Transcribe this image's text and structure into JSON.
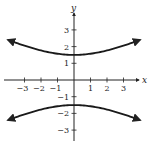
{
  "chart_data": {
    "type": "line",
    "title": "",
    "xlabel": "x",
    "ylabel": "y",
    "xlim": [
      -4,
      4
    ],
    "ylim": [
      -3.6,
      4
    ],
    "grid": false,
    "x_ticks": [
      -3,
      -2,
      -1,
      1,
      2,
      3
    ],
    "x_tick_labels": [
      "−3",
      "−2",
      "−1",
      "1",
      "2",
      "3"
    ],
    "y_ticks": [
      3,
      2,
      1,
      -1,
      -2,
      -3
    ],
    "y_tick_labels": [
      "3",
      "2",
      "1",
      "−1",
      "−2",
      "−3"
    ],
    "series": [
      {
        "name": "upper branch",
        "x": [
          -4,
          -3,
          -2,
          -1,
          0,
          1,
          2,
          3,
          4
        ],
        "y": [
          2.4,
          2.1,
          1.8,
          1.6,
          1.5,
          1.6,
          1.8,
          2.1,
          2.4
        ]
      },
      {
        "name": "lower branch",
        "x": [
          -4,
          -3,
          -2,
          -1,
          0,
          1,
          2,
          3,
          4
        ],
        "y": [
          -2.4,
          -2.1,
          -1.8,
          -1.6,
          -1.5,
          -1.6,
          -1.8,
          -2.1,
          -2.4
        ]
      }
    ]
  },
  "axes": {
    "x_label": "x",
    "y_label": "y"
  }
}
